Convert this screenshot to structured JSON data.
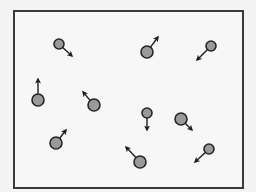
{
  "diagram": {
    "type": "gas-particles-in-box",
    "container": {
      "x": 14,
      "y": 11,
      "width": 229,
      "height": 177,
      "stroke": "#3a3a3a",
      "fill": "#f7f7f7"
    },
    "colors": {
      "particle_fill": "#9a9a9a",
      "particle_stroke": "#262626",
      "arrow": "#1e1e1e",
      "background": "#f4f4f4"
    },
    "particles": [
      {
        "id": 1,
        "cx": 59,
        "cy": 44,
        "r": 5,
        "tip": [
          72,
          56
        ],
        "direction": "down-right"
      },
      {
        "id": 2,
        "cx": 147,
        "cy": 52,
        "r": 6,
        "tip": [
          158,
          37
        ],
        "direction": "up-right"
      },
      {
        "id": 3,
        "cx": 211,
        "cy": 46,
        "r": 5,
        "tip": [
          197,
          60
        ],
        "direction": "down-left"
      },
      {
        "id": 4,
        "cx": 38,
        "cy": 100,
        "r": 6,
        "tip": [
          38,
          79
        ],
        "direction": "up"
      },
      {
        "id": 5,
        "cx": 94,
        "cy": 105,
        "r": 6,
        "tip": [
          83,
          92
        ],
        "direction": "up-left"
      },
      {
        "id": 6,
        "cx": 147,
        "cy": 113,
        "r": 5,
        "tip": [
          147,
          130
        ],
        "direction": "down"
      },
      {
        "id": 7,
        "cx": 181,
        "cy": 119,
        "r": 6,
        "tip": [
          192,
          130
        ],
        "direction": "down-right"
      },
      {
        "id": 8,
        "cx": 56,
        "cy": 143,
        "r": 6,
        "tip": [
          66,
          130
        ],
        "direction": "up-right"
      },
      {
        "id": 9,
        "cx": 140,
        "cy": 162,
        "r": 6,
        "tip": [
          126,
          147
        ],
        "direction": "up-left"
      },
      {
        "id": 10,
        "cx": 209,
        "cy": 149,
        "r": 5,
        "tip": [
          195,
          162
        ],
        "direction": "down-left"
      }
    ]
  }
}
